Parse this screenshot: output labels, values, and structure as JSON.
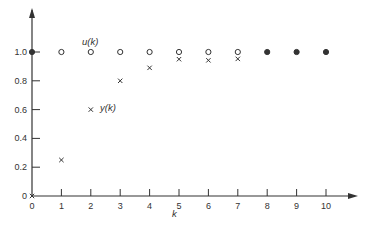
{
  "chart_data": {
    "type": "scatter",
    "title": "",
    "xlabel": "k",
    "ylabel": "",
    "xlim": [
      0,
      10
    ],
    "ylim": [
      0,
      1.0
    ],
    "grid": false,
    "x": [
      0,
      1,
      2,
      3,
      4,
      5,
      6,
      7,
      8,
      9,
      10
    ],
    "x_ticks": [
      "0",
      "1",
      "2",
      "3",
      "4",
      "5",
      "6",
      "7",
      "8",
      "9",
      "10"
    ],
    "y_ticks": [
      "0",
      "0.2",
      "0.4",
      "0.6",
      "0.8",
      "1.0"
    ],
    "y_tick_values": [
      0,
      0.2,
      0.4,
      0.6,
      0.8,
      1.0
    ],
    "series": [
      {
        "name": "u(k)",
        "marker": "circle",
        "values": [
          1,
          1,
          1,
          1,
          1,
          1,
          1,
          1,
          1,
          1,
          1
        ]
      },
      {
        "name": "y(k)",
        "marker": "x",
        "values": [
          0,
          0.25,
          0.6,
          0.8,
          0.89,
          0.95,
          0.97,
          0.98,
          0.99,
          1.0,
          1.0
        ]
      }
    ],
    "annotations": [
      {
        "text": "u(k)",
        "near": "k=2, 1.0"
      },
      {
        "text": "y(k)",
        "near": "k=2, 0.6"
      }
    ],
    "legend": "inline annotations"
  },
  "labels": {
    "x_axis": "k",
    "u_label": "u(k)",
    "y_label": "y(k)"
  }
}
